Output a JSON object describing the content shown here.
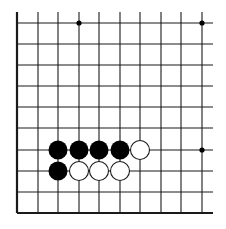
{
  "board": {
    "title": "Go board diagram (partial, lower-left corner)",
    "colors": {
      "background": "#ffffff",
      "line": "#1a1a1a",
      "black_stone": "#000000",
      "white_stone": "#ffffff",
      "white_stone_stroke": "#1a1a1a",
      "star_point": "#000000"
    },
    "grid": {
      "x": [
        17,
        38,
        58,
        79,
        99,
        120,
        140,
        161,
        181,
        202
      ],
      "y": [
        23,
        44,
        65,
        86,
        107,
        128,
        150,
        171,
        192,
        213
      ],
      "top_extend_to": 12,
      "right_extend_to": 213,
      "left_edge_thick": true,
      "bottom_edge_thick": true
    },
    "star_points": [
      {
        "col": 3,
        "row": 0
      },
      {
        "col": 9,
        "row": 0
      },
      {
        "col": 9,
        "row": 6
      }
    ],
    "stones": [
      {
        "color": "black",
        "col": 2,
        "row": 6
      },
      {
        "color": "black",
        "col": 3,
        "row": 6
      },
      {
        "color": "black",
        "col": 4,
        "row": 6
      },
      {
        "color": "black",
        "col": 5,
        "row": 6
      },
      {
        "color": "white",
        "col": 6,
        "row": 6
      },
      {
        "color": "black",
        "col": 2,
        "row": 7
      },
      {
        "color": "white",
        "col": 3,
        "row": 7
      },
      {
        "color": "white",
        "col": 4,
        "row": 7
      },
      {
        "color": "white",
        "col": 5,
        "row": 7
      }
    ],
    "stone_radius": 9.5,
    "star_radius": 2.6
  }
}
